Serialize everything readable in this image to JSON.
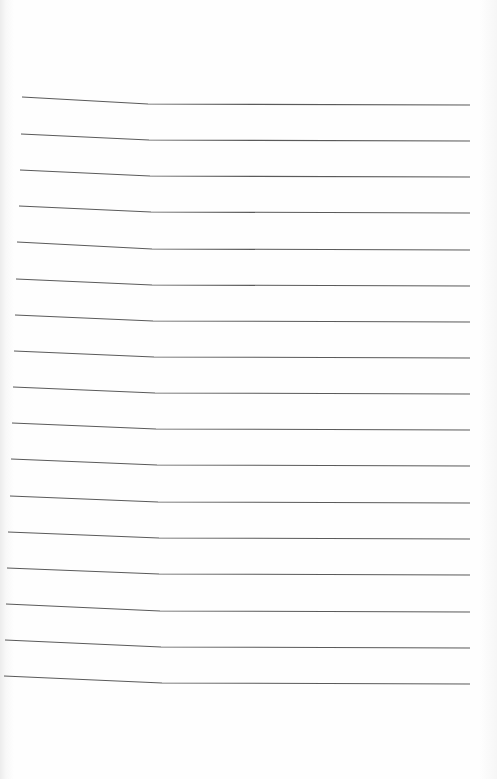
{
  "document": {
    "type": "blank lined notebook page",
    "line_count": 17,
    "line_color": "#5a5a5a",
    "paper_color": "#fdfdfd",
    "text_content": "",
    "lines": [
      {
        "y_left": 97,
        "y_right": 104
      },
      {
        "y_left": 134,
        "y_right": 140
      },
      {
        "y_left": 170,
        "y_right": 176
      },
      {
        "y_left": 206,
        "y_right": 212
      },
      {
        "y_left": 242,
        "y_right": 249
      },
      {
        "y_left": 279,
        "y_right": 285
      },
      {
        "y_left": 315,
        "y_right": 321
      },
      {
        "y_left": 351,
        "y_right": 357
      },
      {
        "y_left": 387,
        "y_right": 393
      },
      {
        "y_left": 423,
        "y_right": 429
      },
      {
        "y_left": 459,
        "y_right": 465
      },
      {
        "y_left": 496,
        "y_right": 502
      },
      {
        "y_left": 532,
        "y_right": 538
      },
      {
        "y_left": 568,
        "y_right": 574
      },
      {
        "y_left": 604,
        "y_right": 611
      },
      {
        "y_left": 640,
        "y_right": 647
      },
      {
        "y_left": 676,
        "y_right": 683
      }
    ]
  }
}
